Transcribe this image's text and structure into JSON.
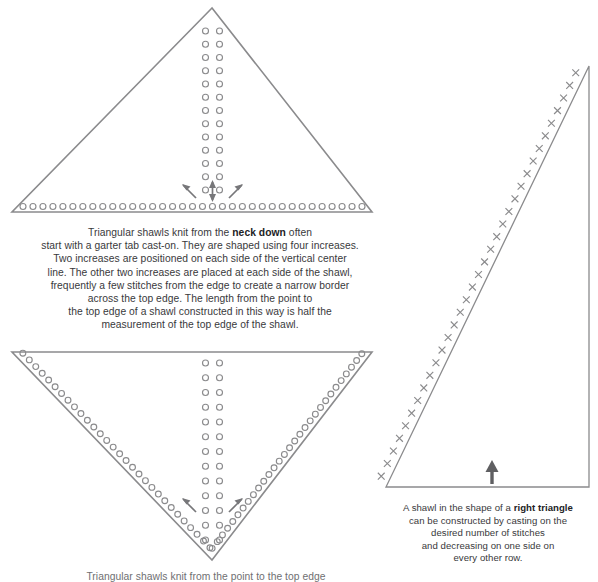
{
  "page": {
    "background_color": "#ffffff",
    "line_color": "#8b8b8d",
    "stitch_color": "#8b8b8d",
    "arrow_color": "#77777a",
    "text_color": "#39393b"
  },
  "captions": {
    "main": {
      "lines": [
        "Triangular shawls knit from the neck down often",
        "start with a garter tab cast-on. They are shaped using four increases.",
        "Two increases are positioned on each side of the vertical center",
        "line. The other two increases are placed at each side of the shawl,",
        "frequently a few stitches from the edge to create a narrow border",
        "across the top edge. The length from the point to",
        "the top edge of a shawl constructed in this way is half the",
        "measurement of the top edge of the shawl."
      ],
      "bold_phrase": "neck down"
    },
    "right": {
      "lines": [
        "A shawl in the shape of a right triangle",
        "can be constructed by casting on the",
        "desired number of stitches",
        "and decreasing on one side on",
        "every other row."
      ],
      "bold_phrase": "right triangle"
    },
    "bottom": {
      "lines": [
        "Triangular shawls knit from the point to the top edge"
      ]
    }
  },
  "figures": [
    {
      "id": "figure-neck-down-triangle",
      "name": "neck-down-triangle-diagram",
      "shape": "isosceles-triangle-apex-up",
      "apex": [
        212,
        8
      ],
      "left_corner": [
        12,
        212
      ],
      "right_corner": [
        372,
        212
      ],
      "stitch_marker": "circle",
      "center_column_pairs": 13,
      "bottom_edge_stitches": 35,
      "arrows": [
        {
          "name": "increase-arrow-left",
          "direction": "up-left"
        },
        {
          "name": "increase-arrow-center",
          "direction": "up-down"
        },
        {
          "name": "increase-arrow-right",
          "direction": "up-right"
        }
      ]
    },
    {
      "id": "figure-point-up-triangle",
      "name": "point-up-triangle-diagram",
      "shape": "isosceles-triangle-apex-down",
      "top_left": [
        12,
        352
      ],
      "top_right": [
        372,
        352
      ],
      "apex": [
        212,
        560
      ],
      "stitch_marker": "circle",
      "center_column_pairs": 13,
      "edge_stitches_per_side": 30,
      "arrows": [
        {
          "name": "increase-arrow-left",
          "direction": "up-left"
        },
        {
          "name": "increase-arrow-right",
          "direction": "up-right"
        }
      ]
    },
    {
      "id": "figure-right-triangle",
      "name": "right-triangle-diagram",
      "shape": "right-triangle",
      "apex": [
        589,
        66
      ],
      "bottom_left": [
        386,
        487
      ],
      "bottom_right": [
        589,
        487
      ],
      "stitch_marker": "x",
      "decrease_marks": 33,
      "arrows": [
        {
          "name": "cast-on-direction-arrow",
          "direction": "up"
        }
      ]
    }
  ]
}
